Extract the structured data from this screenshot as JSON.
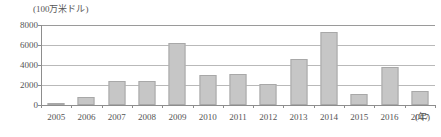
{
  "chart_data": {
    "type": "bar",
    "title": "",
    "unit_caption": "(100万米ドル)",
    "xlabel": "(年)",
    "ylabel": "",
    "ylim": [
      0,
      8000
    ],
    "yticks": [
      0,
      2000,
      4000,
      6000,
      8000
    ],
    "ytick_labels": [
      "0",
      "2000",
      "4000",
      "6000",
      "8000"
    ],
    "grid": true,
    "legend": "none",
    "bar_color": "#c6c6c6",
    "bar_border_color": "#a8a8a8",
    "axis_color": "#8d8d8d",
    "grid_color": "#b9b9b9",
    "categories": [
      "2005",
      "2006",
      "2007",
      "2008",
      "2009",
      "2010",
      "2011",
      "2012",
      "2013",
      "2014",
      "2015",
      "2016",
      "2017"
    ],
    "values": [
      180,
      780,
      2380,
      2450,
      6180,
      3050,
      3150,
      2100,
      4650,
      7300,
      1100,
      3780,
      1400
    ]
  }
}
